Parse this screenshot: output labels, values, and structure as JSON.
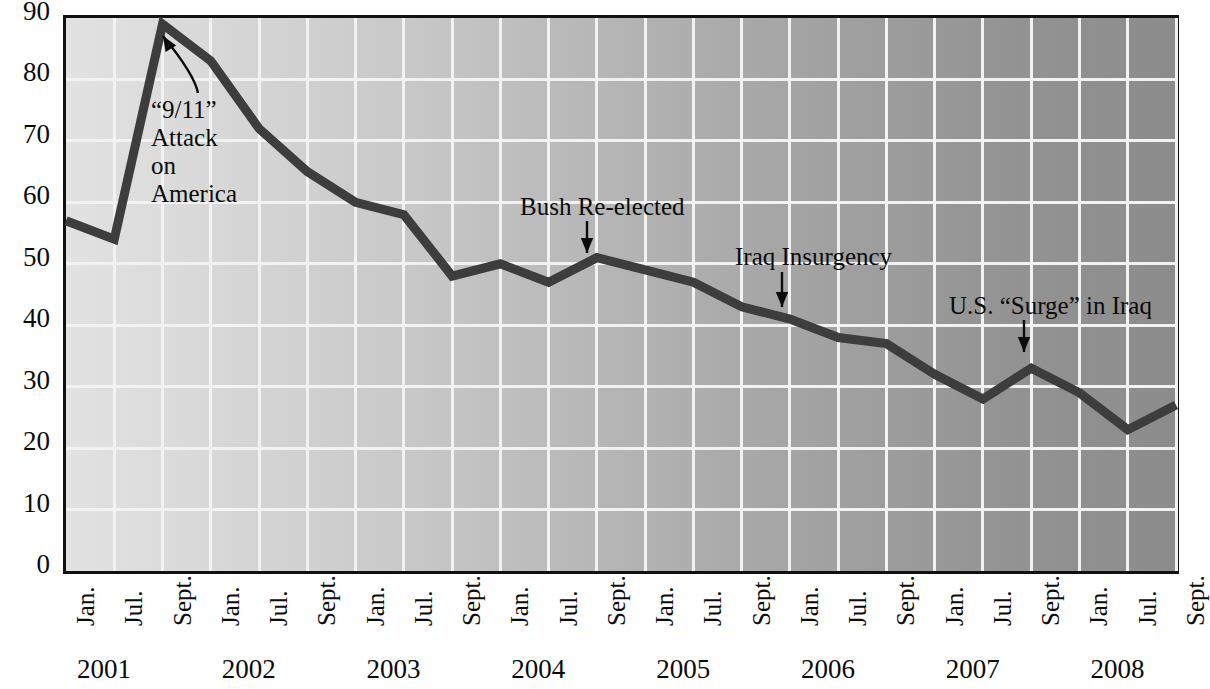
{
  "chart_data": {
    "type": "line",
    "title": "",
    "xlabel": "",
    "ylabel": "",
    "ylim": [
      0,
      90
    ],
    "ytick_step": 10,
    "yticks": [
      0,
      10,
      20,
      30,
      40,
      50,
      60,
      70,
      80,
      90
    ],
    "grid": true,
    "legend": "none",
    "line_color": "#3d3d3d",
    "background_gradient": [
      "#e2e2e2",
      "#8c8c8c"
    ],
    "gridline_color": "#f2f2f2",
    "axis_color": "#111111",
    "categories": [
      "Jan. 2001",
      "Jul. 2001",
      "Sept. 2001",
      "Jan. 2002",
      "Jul. 2002",
      "Sept. 2002",
      "Jan. 2003",
      "Jul. 2003",
      "Sept. 2003",
      "Jan. 2004",
      "Jul. 2004",
      "Sept. 2004",
      "Jan. 2005",
      "Jul. 2005",
      "Sept. 2005",
      "Jan. 2006",
      "Jul. 2006",
      "Sept. 2006",
      "Jan. 2007",
      "Jul. 2007",
      "Sept. 2007",
      "Jan. 2008",
      "Jul. 2008",
      "Sept. 2008"
    ],
    "values": [
      57,
      54,
      89,
      83,
      72,
      65,
      60,
      58,
      48,
      50,
      47,
      51,
      49,
      47,
      43,
      41,
      38,
      37,
      32,
      28,
      33,
      29,
      23,
      27
    ],
    "xtick_labels": [
      "Jan.",
      "Jul.",
      "Sept.",
      "Jan.",
      "Jul.",
      "Sept.",
      "Jan.",
      "Jul.",
      "Sept.",
      "Jan.",
      "Jul.",
      "Sept.",
      "Jan.",
      "Jul.",
      "Sept.",
      "Jan.",
      "Jul.",
      "Sept.",
      "Jan.",
      "Jul.",
      "Sept.",
      "Jan.",
      "Jul.",
      "Sept."
    ],
    "year_labels": [
      "2001",
      "2002",
      "2003",
      "2004",
      "2005",
      "2006",
      "2007",
      "2008"
    ],
    "annotations": [
      {
        "id": "nine-eleven",
        "text": "“9/11”\nAttack\non\nAmerica",
        "point_index": 2,
        "value": 89
      },
      {
        "id": "bush-re-elected",
        "text": "Bush Re-elected",
        "point_index": 11,
        "value": 51
      },
      {
        "id": "iraq-insurgency",
        "text": "Iraq Insurgency",
        "point_index": 15,
        "value": 41
      },
      {
        "id": "us-surge-in-iraq",
        "text": "U.S. “Surge” in Iraq",
        "point_index": 20,
        "value": 33
      }
    ]
  }
}
